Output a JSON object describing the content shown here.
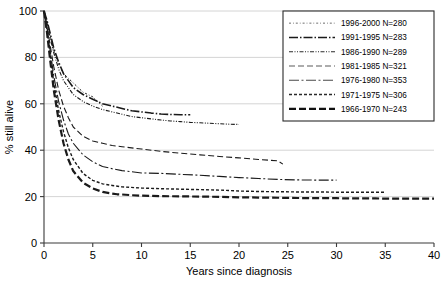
{
  "chart_data": {
    "type": "line",
    "title": "",
    "xlabel": "Years since diagnosis",
    "ylabel": "% still alive",
    "xlim": [
      0,
      40
    ],
    "ylim": [
      0,
      100
    ],
    "xticks": [
      0,
      5,
      10,
      15,
      20,
      25,
      30,
      35,
      40
    ],
    "yticks": [
      0,
      20,
      40,
      60,
      80,
      100
    ],
    "grid": "horizontal",
    "legend_position": "upper-right",
    "series": [
      {
        "name": "1996-2000 N=280",
        "period": "1996-2000",
        "n": 280,
        "dash": "2,2,0.8,2",
        "width": 1.0,
        "color": "#6d6d6d",
        "x": [
          0,
          0.3,
          0.6,
          1.0,
          1.5,
          2.0,
          2.5,
          3.0,
          3.5,
          4.0,
          4.5,
          5.0,
          5.5,
          6.0
        ],
        "y": [
          100,
          96,
          90,
          83,
          77,
          73,
          71,
          69,
          67,
          65,
          64,
          63,
          61,
          59
        ]
      },
      {
        "name": "1991-1995 N=283",
        "period": "1991-1995",
        "n": 283,
        "dash": "9,2,1.5,2",
        "width": 1.6,
        "color": "#1a1a1a",
        "x": [
          0,
          0.3,
          0.6,
          1.0,
          1.5,
          2.0,
          2.5,
          3.0,
          4.0,
          5.0,
          6.0,
          7.0,
          8.0,
          9.0,
          10.0,
          11.0,
          12.0,
          13.0,
          14.0,
          15.0
        ],
        "y": [
          100,
          96,
          91,
          84,
          78,
          73,
          70,
          67,
          64,
          62,
          60,
          59,
          58,
          57,
          56.5,
          56,
          55.6,
          55.4,
          55.3,
          55.3
        ]
      },
      {
        "name": "1986-1990 N=289",
        "period": "1986-1990",
        "n": 289,
        "dash": "4,1.5,1,1.5,1,1.5",
        "width": 1.1,
        "color": "#2a2a2a",
        "x": [
          0,
          0.3,
          0.6,
          1.0,
          1.5,
          2.0,
          2.5,
          3.0,
          4.0,
          5.0,
          6.0,
          7.0,
          8.0,
          9.0,
          10.0,
          11.0,
          12.0,
          13.0,
          14.0,
          15.0,
          16.0,
          17.0,
          18.0,
          19.0,
          20.0
        ],
        "y": [
          100,
          95,
          89,
          82,
          75,
          70,
          67,
          64,
          61,
          59,
          57.5,
          56.5,
          55.5,
          54.5,
          54,
          53.5,
          53,
          52.6,
          52.3,
          52,
          51.8,
          51.6,
          51.4,
          51.2,
          51.1
        ]
      },
      {
        "name": "1981-1985 N=321",
        "period": "1981-1985",
        "n": 321,
        "dash": "6,3",
        "width": 1.1,
        "color": "#5a5a5a",
        "x": [
          0,
          0.3,
          0.6,
          1.0,
          1.5,
          2.0,
          2.5,
          3.0,
          4.0,
          5.0,
          6.0,
          7.0,
          8.0,
          10.0,
          12.0,
          14.0,
          16.0,
          18.0,
          20.0,
          22.0,
          23.0,
          24.0,
          24.5
        ],
        "y": [
          100,
          94,
          86,
          76,
          66,
          59,
          54,
          50,
          46,
          44,
          43,
          42,
          41.5,
          40.5,
          39.5,
          38.7,
          38,
          37.3,
          36.7,
          36,
          35.7,
          35.4,
          34
        ]
      },
      {
        "name": "1976-1980 N=353",
        "period": "1976-1980",
        "n": 353,
        "dash": "10,2.5,2,2.5",
        "width": 1.1,
        "color": "#4a4a4a",
        "x": [
          0,
          0.3,
          0.6,
          1.0,
          1.5,
          2.0,
          2.5,
          3.0,
          4.0,
          5.0,
          6.0,
          7.0,
          8.0,
          10.0,
          12.0,
          14.0,
          16.0,
          18.0,
          20.0,
          22.0,
          24.0,
          26.0,
          28.0,
          29.0,
          30.0
        ],
        "y": [
          100,
          93,
          84,
          72,
          61,
          53,
          47,
          43,
          38,
          35,
          33,
          32,
          31.2,
          30.2,
          30,
          29.6,
          29.2,
          28.7,
          28.2,
          27.8,
          27.4,
          27.2,
          27.1,
          27.1,
          27.1
        ]
      },
      {
        "name": "1971-1975 N=306",
        "period": "1971-1975",
        "n": 306,
        "dash": "3,2",
        "width": 1.4,
        "color": "#2a2a2a",
        "x": [
          0,
          0.3,
          0.6,
          1.0,
          1.5,
          2.0,
          2.5,
          3.0,
          4.0,
          5.0,
          6.0,
          7.0,
          8.0,
          10.0,
          12.0,
          14.0,
          16.0,
          18.0,
          20.0,
          22.0,
          24.0,
          26.0,
          28.0,
          30.0,
          32.0,
          34.0,
          35.0
        ],
        "y": [
          100,
          92,
          82,
          69,
          57,
          48,
          41,
          36,
          30,
          27,
          25.5,
          24.8,
          24.2,
          23.7,
          23.4,
          23.2,
          23,
          22.8,
          22.4,
          22.2,
          22.1,
          22.0,
          22.0,
          21.9,
          21.9,
          21.9,
          21.9
        ]
      },
      {
        "name": "1966-1970 N=243",
        "period": "1966-1970",
        "n": 243,
        "dash": "7,3",
        "width": 2.2,
        "color": "#111111",
        "x": [
          0,
          0.3,
          0.6,
          1.0,
          1.5,
          2.0,
          2.5,
          3.0,
          4.0,
          5.0,
          6.0,
          7.0,
          7.5,
          8.0,
          9.0,
          10.0,
          12.0,
          14.0,
          16.0,
          18.0,
          20.0,
          22.0,
          24.0,
          26.0,
          28.0,
          30.0,
          32.0,
          34.0,
          36.0,
          38.0,
          40.0
        ],
        "y": [
          100,
          91,
          80,
          66,
          53,
          43,
          36,
          31,
          26,
          23.5,
          22,
          21.3,
          21.0,
          20.9,
          20.6,
          20.4,
          20.2,
          20.1,
          20.0,
          19.9,
          19.7,
          19.6,
          19.5,
          19.4,
          19.3,
          19.3,
          19.2,
          19.2,
          19.1,
          19.1,
          19.1
        ]
      }
    ]
  },
  "axes": {
    "y_title": "% still alive",
    "x_title": "Years since diagnosis",
    "x_tick_labels": [
      "0",
      "5",
      "10",
      "15",
      "20",
      "25",
      "30",
      "35",
      "40"
    ],
    "y_tick_labels": [
      "0",
      "20",
      "40",
      "60",
      "80",
      "100"
    ]
  },
  "legend": {
    "items": [
      {
        "label": "1996-2000 N=280"
      },
      {
        "label": "1991-1995 N=283"
      },
      {
        "label": "1986-1990 N=289"
      },
      {
        "label": "1981-1985 N=321"
      },
      {
        "label": "1976-1980 N=353"
      },
      {
        "label": "1971-1975 N=306"
      },
      {
        "label": "1966-1970 N=243"
      }
    ]
  },
  "colors": {
    "grid": "#c9c9c9",
    "axis": "#3a3a3a",
    "ink": "#1a1a1a",
    "background": "#ffffff"
  }
}
